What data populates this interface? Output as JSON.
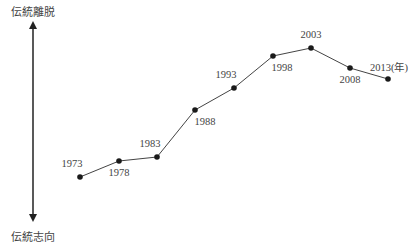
{
  "chart_data": {
    "type": "line",
    "title": "",
    "xlabel": "(年)",
    "ylabel_top": "伝統離脱",
    "ylabel_bottom": "伝統志向",
    "x": [
      "1973",
      "1978",
      "1983",
      "1988",
      "1993",
      "1998",
      "2003",
      "2008",
      "2013"
    ],
    "series": [
      {
        "name": "trend",
        "values": [
          9,
          24,
          28,
          73,
          94,
          125,
          133,
          114,
          103
        ]
      }
    ],
    "ylim": [
      0,
      185
    ],
    "grid": false,
    "legend": "none",
    "annotations": [
      "2013(年)"
    ]
  },
  "axis": {
    "top_label": "伝統離脱",
    "bottom_label": "伝統志向"
  },
  "points": [
    {
      "year": "1973",
      "x": 80,
      "y": 177,
      "lx": 72,
      "ly": 167,
      "anchor": "middle"
    },
    {
      "year": "1978",
      "x": 119,
      "y": 161,
      "lx": 119,
      "ly": 176,
      "anchor": "middle"
    },
    {
      "year": "1983",
      "x": 157,
      "y": 157,
      "lx": 150,
      "ly": 147,
      "anchor": "middle"
    },
    {
      "year": "1988",
      "x": 195,
      "y": 110,
      "lx": 205,
      "ly": 125,
      "anchor": "middle"
    },
    {
      "year": "1993",
      "x": 234,
      "y": 88,
      "lx": 226,
      "ly": 78,
      "anchor": "middle"
    },
    {
      "year": "1998",
      "x": 273,
      "y": 56,
      "lx": 282,
      "ly": 71,
      "anchor": "middle"
    },
    {
      "year": "2003",
      "x": 311,
      "y": 48,
      "lx": 311,
      "ly": 38,
      "anchor": "middle"
    },
    {
      "year": "2008",
      "x": 350,
      "y": 68,
      "lx": 350,
      "ly": 83,
      "anchor": "middle"
    },
    {
      "year": "2013",
      "x": 388,
      "y": 79,
      "lx": 370,
      "ly": 71,
      "anchor": "start",
      "text": "2013(年)"
    }
  ]
}
